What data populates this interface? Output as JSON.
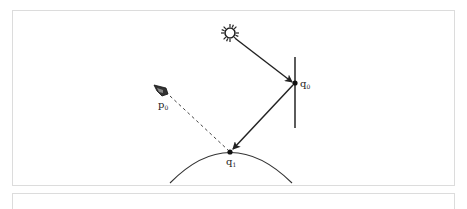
{
  "diagram": {
    "labels": {
      "p0": {
        "base": "p",
        "sub": "0"
      },
      "q0": {
        "base": "q",
        "sub": "0"
      },
      "q1": {
        "base": "q",
        "sub": "1"
      }
    },
    "icons": {
      "light": "sun-icon",
      "viewer": "eye-icon"
    },
    "colors": {
      "stroke": "#222222",
      "dashed": "#444444",
      "surface": "#333333",
      "frame": "#dcdcdc"
    }
  }
}
